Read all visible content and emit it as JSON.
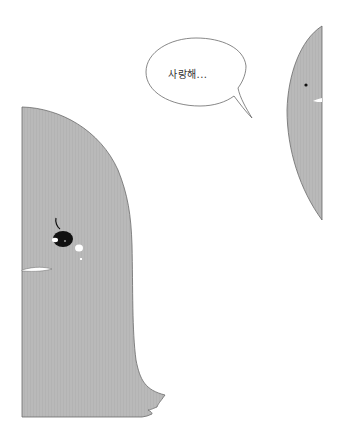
{
  "panel": {
    "speech_bubble": {
      "text": "사랑해..."
    },
    "characters": [
      {
        "name": "large-gray-creature",
        "features": [
          "eye",
          "mouth",
          "black-bird-with-blush"
        ]
      },
      {
        "name": "partial-gray-creature-right",
        "features": [
          "eye",
          "mouth"
        ]
      }
    ]
  },
  "colors": {
    "background": "#ffffff",
    "body_fill": "#b9b9b9",
    "outline": "#6a6a6a",
    "eye": "#111111",
    "highlight": "#ffffff"
  }
}
